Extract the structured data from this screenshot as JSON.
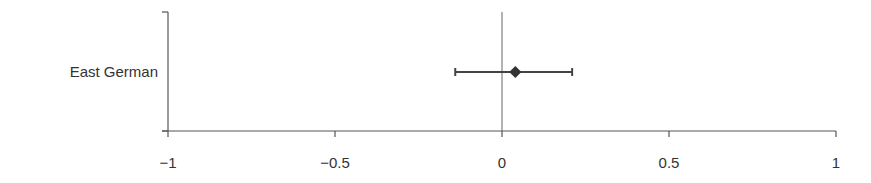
{
  "chart_data": {
    "type": "forest",
    "title": "",
    "xlabel": "",
    "ylabel": "",
    "xlim": [
      -1,
      1
    ],
    "x_ticks": [
      -1,
      -0.5,
      0,
      0.5,
      1
    ],
    "x_tick_labels": [
      "−1",
      "−0.5",
      "0",
      "0.5",
      "1"
    ],
    "reference_line": 0,
    "categories": [
      "East German"
    ],
    "series": [
      {
        "name": "East German",
        "estimate": 0.04,
        "ci_lower": -0.14,
        "ci_upper": 0.21
      }
    ],
    "grid": false,
    "legend": null
  }
}
